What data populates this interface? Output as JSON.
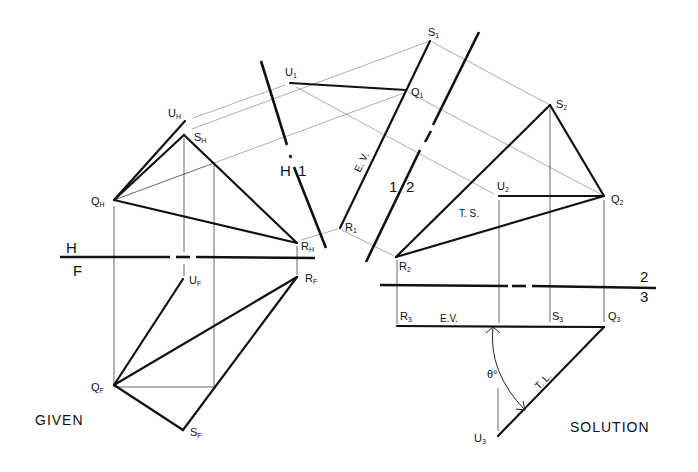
{
  "captions": {
    "given": "GIVEN",
    "solution": "SOLUTION"
  },
  "fold_lines": {
    "hf": {
      "top": "H",
      "bottom": "F"
    },
    "h1": {
      "left": "H",
      "right": "1"
    },
    "one_two": {
      "left": "1",
      "right": "2"
    },
    "two_three": {
      "top": "2",
      "bottom": "3"
    }
  },
  "points": {
    "horizontal_view": [
      {
        "letter": "U",
        "sub": "H"
      },
      {
        "letter": "S",
        "sub": "H"
      },
      {
        "letter": "Q",
        "sub": "H"
      },
      {
        "letter": "R",
        "sub": "H"
      }
    ],
    "front_view": [
      {
        "letter": "U",
        "sub": "F"
      },
      {
        "letter": "R",
        "sub": "F"
      },
      {
        "letter": "Q",
        "sub": "F"
      },
      {
        "letter": "S",
        "sub": "F"
      }
    ],
    "view_1": [
      {
        "letter": "U",
        "sub": "1"
      },
      {
        "letter": "S",
        "sub": "1"
      },
      {
        "letter": "Q",
        "sub": "1"
      },
      {
        "letter": "R",
        "sub": "1"
      }
    ],
    "view_2": [
      {
        "letter": "S",
        "sub": "2"
      },
      {
        "letter": "U",
        "sub": "2"
      },
      {
        "letter": "Q",
        "sub": "2"
      },
      {
        "letter": "R",
        "sub": "2"
      }
    ],
    "view_3": [
      {
        "letter": "R",
        "sub": "3"
      },
      {
        "letter": "S",
        "sub": "3"
      },
      {
        "letter": "Q",
        "sub": "3"
      },
      {
        "letter": "U",
        "sub": "3"
      }
    ]
  },
  "annotations": {
    "ev_view1": "E. V.",
    "ts_view2": "T. S.",
    "ev_view3": "E.V.",
    "tl_view3": "T. L.",
    "angle": "θ°"
  },
  "colors": {
    "ink": "#111111",
    "projection": "#555555",
    "background": "#ffffff"
  }
}
